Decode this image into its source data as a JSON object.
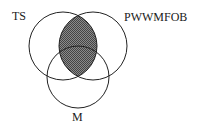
{
  "diagram": {
    "type": "venn",
    "sets": [
      {
        "id": "ts",
        "label": "TS"
      },
      {
        "id": "pwwmfob",
        "label": "PWWMFOB"
      },
      {
        "id": "m",
        "label": "M"
      }
    ],
    "shaded_region": "TS ∩ PWWMFOB",
    "colors": {
      "stroke": "#222222",
      "shade": "#6a6a6a",
      "background": "#ffffff"
    }
  }
}
